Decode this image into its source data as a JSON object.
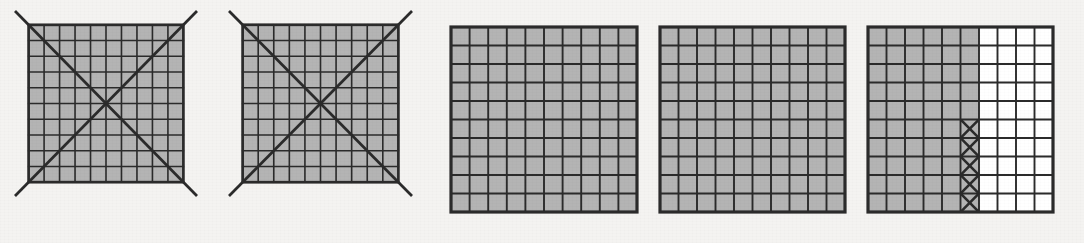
{
  "figure": {
    "background_color": "#f4f3f1",
    "canvas": {
      "width": 1084,
      "height": 243
    },
    "stroke_color": "#2b2b2b",
    "shaded_cell_color": "#b4b4b4",
    "empty_cell_color": "#ffffff",
    "grid_rows": 10,
    "grid_cols": 10,
    "panels": [
      {
        "id": "panel-1",
        "label": "Shaded 10x10 grid with crossed diagonals",
        "x": 31,
        "y": 27,
        "width": 182,
        "height": 185,
        "shaded_columns": 10,
        "overlay": "x-diagonals",
        "diagonal_overrun": 16,
        "outer_stroke_width": 3.2,
        "inner_stroke_width": 1.9,
        "diagonal_stroke_width": 3.2,
        "marked_cells": []
      },
      {
        "id": "panel-2",
        "label": "Shaded 10x10 grid with crossed diagonals",
        "x": 245,
        "y": 27,
        "width": 183,
        "height": 185,
        "shaded_columns": 10,
        "overlay": "x-diagonals",
        "diagonal_overrun": 16,
        "outer_stroke_width": 3.2,
        "inner_stroke_width": 1.9,
        "diagonal_stroke_width": 3.2,
        "marked_cells": []
      },
      {
        "id": "panel-3",
        "label": "Plain shaded 10x10 grid",
        "x": 451,
        "y": 27,
        "width": 186,
        "height": 185,
        "shaded_columns": 10,
        "overlay": "none",
        "diagonal_overrun": 0,
        "outer_stroke_width": 3.2,
        "inner_stroke_width": 1.9,
        "diagonal_stroke_width": 0,
        "marked_cells": []
      },
      {
        "id": "panel-4",
        "label": "Plain shaded 10x10 grid",
        "x": 660,
        "y": 27,
        "width": 185,
        "height": 185,
        "shaded_columns": 10,
        "overlay": "none",
        "diagonal_overrun": 0,
        "outer_stroke_width": 3.2,
        "inner_stroke_width": 1.9,
        "diagonal_stroke_width": 0,
        "marked_cells": []
      },
      {
        "id": "panel-5",
        "label": "10x10 grid shaded six columns with five crossed cells",
        "x": 868,
        "y": 27,
        "width": 185,
        "height": 185,
        "shaded_columns": 6,
        "overlay": "none",
        "diagonal_overrun": 0,
        "outer_stroke_width": 3.2,
        "inner_stroke_width": 1.9,
        "diagonal_stroke_width": 0,
        "marked_cells": [
          {
            "col": 6,
            "row": 6
          },
          {
            "col": 6,
            "row": 7
          },
          {
            "col": 6,
            "row": 8
          },
          {
            "col": 6,
            "row": 9
          },
          {
            "col": 6,
            "row": 10
          }
        ]
      }
    ]
  }
}
